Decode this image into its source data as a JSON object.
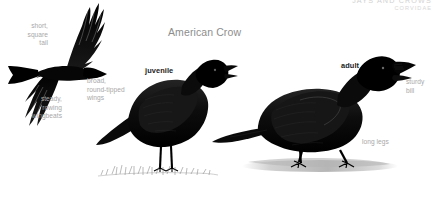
{
  "page": {
    "width": 436,
    "height": 213,
    "background": "#ffffff"
  },
  "running_head": {
    "family_common": "JAYS AND CROWS",
    "family_latin": "CORVIDAE",
    "color": "#d2d2d2"
  },
  "species": {
    "common_name": "American Crow",
    "title_color": "#8d8d8d"
  },
  "figures": [
    {
      "id": "flight",
      "name": "crow-in-flight",
      "pose": "flying, viewed from below, head to the right, wings spread",
      "silhouette_color": "#0b0b0b"
    },
    {
      "id": "juvenile",
      "name": "juvenile-crow-perched",
      "pose": "standing on grass, facing right, bill open",
      "plumage_color": "#141414"
    },
    {
      "id": "adult",
      "name": "adult-crow-standing",
      "pose": "standing on bare ground with cast shadow, facing right",
      "plumage_color": "#101010"
    }
  ],
  "age_labels": {
    "juvenile": "juvenile",
    "adult": "adult",
    "color": "#1c1c1c"
  },
  "callouts": {
    "short_square_tail": "short,\nsquare\ntail",
    "steady_rowing_wingbeats": "steady,\nrowing\nwingbeats",
    "broad_round_tipped_wings": "broad,\nround-tipped\nwings",
    "sturdy_bill": "sturdy\nbill",
    "long_legs": "long legs",
    "color": "#a8a8a8"
  }
}
